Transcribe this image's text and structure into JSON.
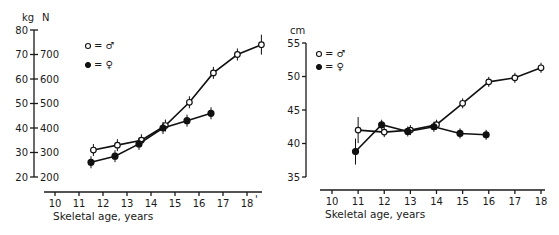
{
  "chart_data": [
    {
      "type": "line",
      "title": "",
      "xlabel": "Skeletal age, years",
      "ylabel": "kg",
      "ylabel_secondary": "N",
      "xlim": [
        10,
        18
      ],
      "ylim": [
        20,
        80
      ],
      "x_ticks": [
        10,
        11,
        12,
        13,
        14,
        15,
        16,
        17,
        18
      ],
      "y_ticks": [
        20,
        30,
        40,
        50,
        60,
        70,
        80
      ],
      "y_ticks_secondary": [
        200,
        300,
        400,
        500,
        600,
        700
      ],
      "grid": false,
      "legend": [
        {
          "marker": "open-circle",
          "label": "= ♂"
        },
        {
          "marker": "filled-circle",
          "label": "= ♀"
        }
      ],
      "series": [
        {
          "name": "♂ (open circles)",
          "x": [
            11.6,
            12.6,
            13.6,
            14.6,
            15.6,
            16.6,
            17.6,
            18.6
          ],
          "values": [
            31,
            33,
            35,
            41,
            50.5,
            62.5,
            70,
            74
          ]
        },
        {
          "name": "♀ (filled circles)",
          "x": [
            11.5,
            12.5,
            13.5,
            14.5,
            15.5,
            16.5
          ],
          "values": [
            26,
            28.5,
            33.5,
            40,
            43,
            46
          ]
        }
      ]
    },
    {
      "type": "line",
      "title": "",
      "xlabel": "Skeletal age, years",
      "ylabel": "cm",
      "xlim": [
        10,
        18
      ],
      "ylim": [
        35,
        55
      ],
      "x_ticks": [
        10,
        11,
        12,
        13,
        14,
        15,
        16,
        17,
        18
      ],
      "y_ticks": [
        35,
        40,
        45,
        50,
        55
      ],
      "grid": false,
      "legend": [
        {
          "marker": "open-circle",
          "label": "= ♂"
        },
        {
          "marker": "filled-circle",
          "label": "= ♀"
        }
      ],
      "series": [
        {
          "name": "♂ (open circles)",
          "x": [
            11,
            12,
            13,
            14,
            15,
            16,
            17,
            18
          ],
          "values": [
            42,
            41.7,
            42,
            42.8,
            46,
            49.2,
            49.8,
            51.3
          ]
        },
        {
          "name": "♀ (filled circles)",
          "x": [
            10.9,
            11.9,
            12.9,
            13.9,
            14.9,
            15.9
          ],
          "values": [
            38.8,
            42.8,
            41.8,
            42.5,
            41.5,
            41.3
          ]
        }
      ]
    }
  ],
  "left": {
    "unit_primary": "kg",
    "unit_secondary": "N",
    "xlabel": "Skeletal age, years",
    "legend_male": "= ♂",
    "legend_female": "= ♀",
    "x_end_mark": "'"
  },
  "right": {
    "unit": "cm",
    "xlabel": "Skeletal age, years",
    "legend_male": "= ♂",
    "legend_female": "= ♀"
  }
}
